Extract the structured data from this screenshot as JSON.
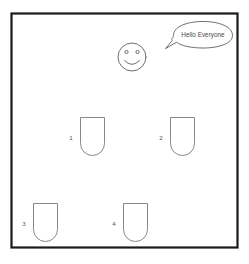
{
  "scene": {
    "title": "Classroom Seating Diagram",
    "background_color": "#ffffff",
    "frame": {
      "name": "room-border",
      "stroke_color": "#1a1a1a",
      "x": 11,
      "y": 13,
      "width": 227,
      "height": 235
    }
  },
  "speech_bubble": {
    "text": "Hello Everyone",
    "stroke_color": "#5f5f5f",
    "fill_color": "#ffffff"
  },
  "teacher": {
    "name": "smiley-face",
    "expression": "smiling",
    "eyes": 2,
    "stroke_color": "#5f5f5f",
    "center_x": 132,
    "center_y": 57,
    "radius": 14
  },
  "desks": [
    {
      "label": "1",
      "x": 80,
      "y": 117,
      "width": 25,
      "height": 39,
      "label_x": 71,
      "label_y": 139
    },
    {
      "label": "2",
      "x": 170,
      "y": 117,
      "width": 25,
      "height": 39,
      "label_x": 161,
      "label_y": 139
    },
    {
      "label": "3",
      "x": 33,
      "y": 203,
      "width": 25,
      "height": 39,
      "label_x": 24,
      "label_y": 225
    },
    {
      "label": "4",
      "x": 123,
      "y": 203,
      "width": 25,
      "height": 39,
      "label_x": 114,
      "label_y": 225
    }
  ],
  "colors": {
    "frame": "#1a1a1a",
    "outline": "#6b6b6b",
    "desk_outline": "#7a7a7a",
    "text": "#4a4a4a",
    "background": "#ffffff"
  }
}
